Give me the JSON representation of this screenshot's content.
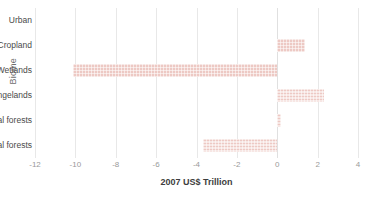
{
  "chart_data": {
    "type": "bar",
    "orientation": "horizontal",
    "title": "",
    "xlabel": "2007 US$ Trillion",
    "ylabel": "Biome",
    "xlim": [
      -12,
      4
    ],
    "xticks": [
      -12,
      -10,
      -8,
      -6,
      -4,
      -2,
      0,
      2,
      4
    ],
    "xtick_labels": [
      "-12",
      "-10",
      "-8",
      "-6",
      "-4",
      "-2",
      "0",
      "2",
      "4"
    ],
    "grid": true,
    "legend": "none",
    "categories": [
      "Urban",
      "Cropland",
      "Wetlands",
      "Grass/Rangelands",
      "Temperate/Boreal forests",
      "Tropical forests"
    ],
    "values": [
      0.0,
      1.35,
      -10.1,
      2.3,
      0.2,
      -3.7
    ],
    "bar_color": "#edc9c4",
    "bar_pattern": "checkered",
    "gridline_color": "#e8e8e8",
    "tick_label_color": "#9a9a9a",
    "category_label_color": "#4a4a4a"
  }
}
